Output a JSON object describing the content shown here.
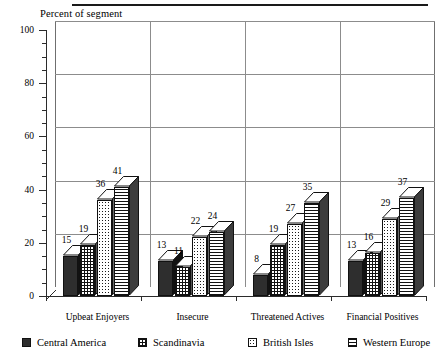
{
  "chart_data": {
    "type": "bar",
    "title": "",
    "ylabel": "Percent of segment",
    "xlabel": "",
    "ylim": [
      0,
      100
    ],
    "ytick_step": 20,
    "yticks": [
      0,
      20,
      40,
      60,
      80,
      100
    ],
    "ytick_labels": [
      "0",
      "20",
      "40",
      "60",
      "80",
      "100"
    ],
    "minor_tick_step": 5,
    "grid": "horizontal",
    "legend_position": "bottom",
    "style": "3d-extruded-bars",
    "categories": [
      "Upbeat Enjoyers",
      "Insecure",
      "Threatened Actives",
      "Financial Positives"
    ],
    "series": [
      {
        "name": "Central America",
        "pattern": "solid-dark",
        "values": [
          15,
          13,
          8,
          13
        ]
      },
      {
        "name": "Scandinavia",
        "pattern": "crosshatch",
        "values": [
          19,
          11,
          19,
          16
        ]
      },
      {
        "name": "British Isles",
        "pattern": "stipple-dots",
        "values": [
          36,
          22,
          27,
          29
        ]
      },
      {
        "name": "Western Europe",
        "pattern": "horizontal-lines",
        "values": [
          41,
          24,
          35,
          37
        ]
      }
    ],
    "data_labels": [
      [
        "15",
        "19",
        "36",
        "41"
      ],
      [
        "13",
        "11",
        "22",
        "24"
      ],
      [
        "8",
        "19",
        "27",
        "35"
      ],
      [
        "13",
        "16",
        "29",
        "37"
      ]
    ]
  },
  "legend": {
    "items": [
      {
        "label": "Central America"
      },
      {
        "label": "Scandinavia"
      },
      {
        "label": "British Isles"
      },
      {
        "label": "Western Europe"
      }
    ]
  }
}
